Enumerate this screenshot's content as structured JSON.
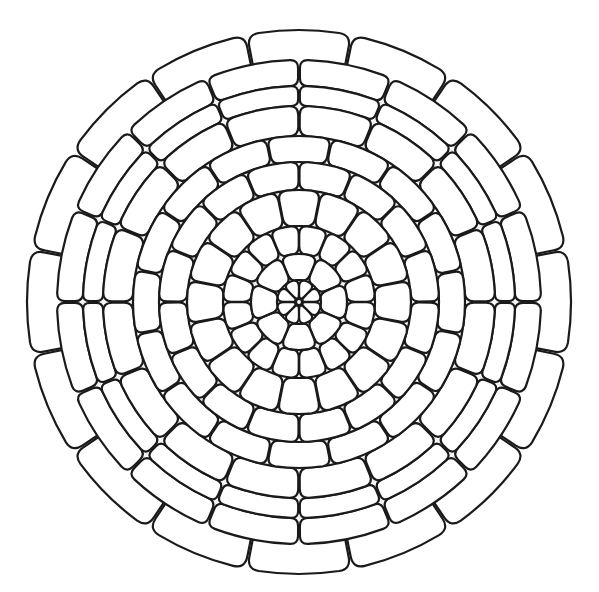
{
  "image": {
    "description": "Black line-art mandala coloring page with concentric rings of rounded petal-shaped cells on a white background",
    "background": "#ffffff",
    "line_color": "#1a1a1a",
    "guide_color": "#e6e6e6"
  },
  "mandala": {
    "center": [
      299,
      302
    ],
    "center_dot_radius": 3,
    "guides": {
      "circles": [
        48,
        110,
        165,
        215
      ],
      "spokes": 16
    },
    "rings": [
      {
        "name": "inner-petals",
        "r0": 4,
        "r1": 22,
        "count": 8,
        "offset": 0.5,
        "round": 7
      },
      {
        "name": "ring-1",
        "r0": 22,
        "r1": 48,
        "count": 8,
        "offset": 0,
        "round": 8
      },
      {
        "name": "ring-2",
        "r0": 48,
        "r1": 76,
        "count": 16,
        "offset": 0.5,
        "round": 8
      },
      {
        "name": "ring-3",
        "r0": 76,
        "r1": 112,
        "count": 16,
        "offset": 0,
        "round": 9
      },
      {
        "name": "ring-4",
        "r0": 112,
        "r1": 140,
        "count": 16,
        "offset": 0.5,
        "round": 8
      },
      {
        "name": "ring-5",
        "r0": 140,
        "r1": 166,
        "count": 16,
        "offset": 0,
        "round": 8
      },
      {
        "name": "ring-6",
        "r0": 166,
        "r1": 196,
        "count": 16,
        "offset": 0.5,
        "round": 9
      },
      {
        "name": "ring-7",
        "r0": 196,
        "r1": 216,
        "count": 16,
        "offset": 0.5,
        "round": 7
      },
      {
        "name": "ring-8",
        "r0": 216,
        "r1": 242,
        "count": 16,
        "offset": 0.5,
        "round": 8
      },
      {
        "name": "outer-petals",
        "r0": 228,
        "r1": 272,
        "count": 16,
        "offset": 0,
        "round": 12
      }
    ]
  }
}
